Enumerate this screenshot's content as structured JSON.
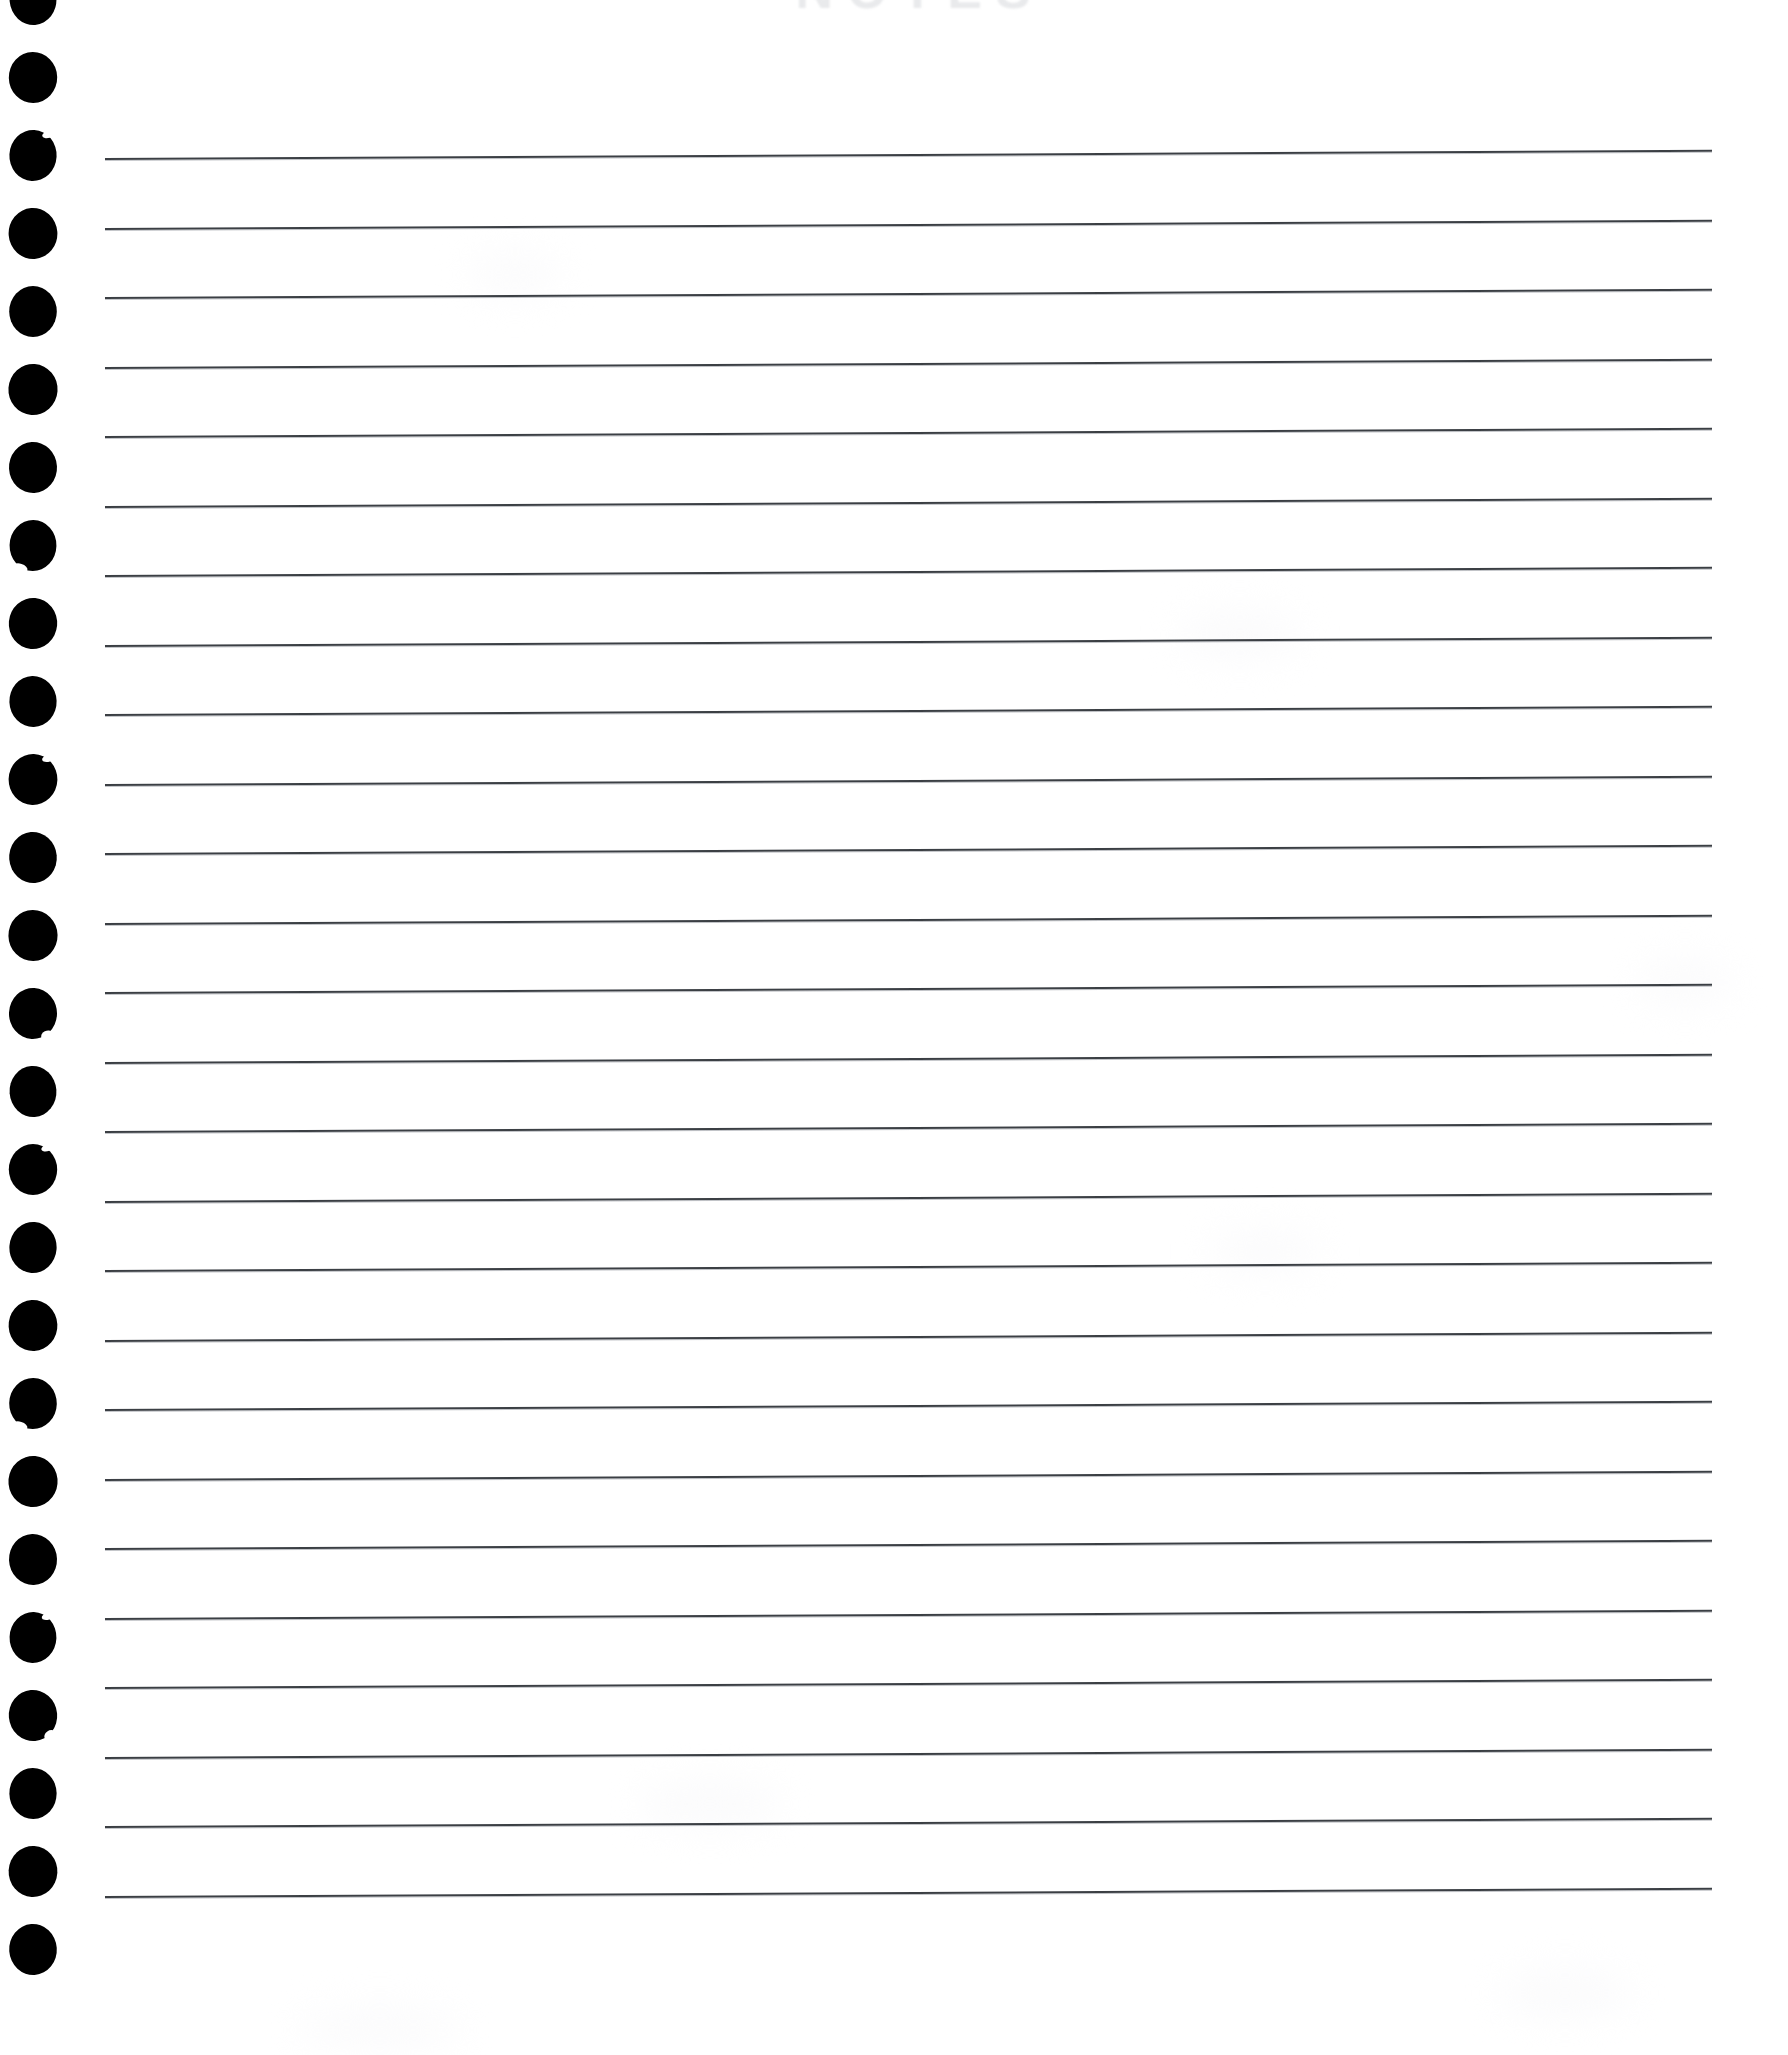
{
  "page": {
    "kind": "lined-notepad-page",
    "width": 1788,
    "height": 2055,
    "background_color": "#ffffff",
    "paper_tint_color": "#fbfbfc"
  },
  "heading": {
    "text": "NOTES",
    "note": "heading is cropped off the top edge and appears only as a very faint pale-gray ghost",
    "color": "#e9eaec",
    "left": 700,
    "top": -34,
    "width": 440,
    "font_size_px": 52,
    "letter_spacing_px": 14
  },
  "binding": {
    "name": "punch-hole-column",
    "hole_color": "#000000",
    "hole_count": 26,
    "hole_width_px": 48,
    "hole_height_px": 51,
    "hole_left_px": 9,
    "hole_pitch_px": 78,
    "first_hole_top_px": -26,
    "nicks": {
      "2": "nick-tr",
      "7": "nick-bl",
      "10": "nick-tr",
      "13": "nick-br",
      "15": "nick-tr",
      "18": "nick-bl",
      "21": "nick-tr",
      "22": "nick-br"
    }
  },
  "rules": {
    "name": "ruled-lines",
    "count": 26,
    "color": "#3b3f44",
    "shadow_color": "rgba(120,125,132,0.45)",
    "left_px": 105,
    "right_px": 1712,
    "length_px": 1607,
    "thickness_px": 2,
    "first_line_top_px": 158,
    "pitch_px": 69.5,
    "tilt_deg": -0.29
  },
  "tints": [
    {
      "left": 470,
      "top": 255,
      "width": 90,
      "height": 40
    },
    {
      "left": 1180,
      "top": 610,
      "width": 120,
      "height": 50
    },
    {
      "left": 1640,
      "top": 960,
      "width": 90,
      "height": 45
    },
    {
      "left": 1210,
      "top": 1230,
      "width": 110,
      "height": 44
    },
    {
      "left": 640,
      "top": 1780,
      "width": 140,
      "height": 48
    },
    {
      "left": 300,
      "top": 2010,
      "width": 160,
      "height": 40
    },
    {
      "left": 1500,
      "top": 1970,
      "width": 130,
      "height": 46
    }
  ]
}
